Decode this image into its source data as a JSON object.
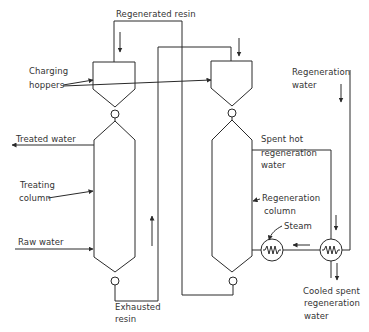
{
  "diagram": {
    "type": "process-flow",
    "stroke_color": "#2a2a2a",
    "labels": {
      "regenerated_resin": "Regenerated resin",
      "charging_hoppers_1": "Charging",
      "charging_hoppers_2": "hoppers",
      "treated_water": "Treated water",
      "treating_column_1": "Treating",
      "treating_column_2": "column",
      "raw_water": "Raw water",
      "exhausted_resin_1": "Exhausted",
      "exhausted_resin_2": "resin",
      "regeneration_water_1": "Regeneration",
      "regeneration_water_2": "water",
      "spent_hot_1": "Spent hot",
      "spent_hot_2": "regeneration",
      "spent_hot_3": "water",
      "regeneration_column_1": "Regeneration",
      "regeneration_column_2": "column",
      "steam": "Steam",
      "cooled_spent_1": "Cooled spent",
      "cooled_spent_2": "regeneration",
      "cooled_spent_3": "water"
    },
    "nodes": [
      {
        "id": "hopper-left",
        "label": "Charging hopper (treating)"
      },
      {
        "id": "hopper-right",
        "label": "Charging hopper (regeneration)"
      },
      {
        "id": "treating-column",
        "label": "Treating column"
      },
      {
        "id": "regeneration-column",
        "label": "Regeneration column"
      },
      {
        "id": "steam-heater",
        "label": "Steam heater"
      },
      {
        "id": "heat-exchanger",
        "label": "Heat exchanger"
      }
    ],
    "flows": [
      {
        "from": "raw-water",
        "to": "treating-column",
        "label": "Raw water"
      },
      {
        "from": "treating-column",
        "to": "out",
        "label": "Treated water"
      },
      {
        "from": "treating-column",
        "to": "hopper-right",
        "label": "Exhausted resin"
      },
      {
        "from": "regeneration-column",
        "to": "hopper-left",
        "label": "Regenerated resin"
      },
      {
        "from": "regeneration-water",
        "to": "heat-exchanger",
        "label": "Regeneration water"
      },
      {
        "from": "heat-exchanger",
        "to": "steam-heater",
        "label": ""
      },
      {
        "from": "steam-heater",
        "to": "regeneration-column",
        "label": "Steam"
      },
      {
        "from": "regeneration-column",
        "to": "heat-exchanger",
        "label": "Spent hot regeneration water"
      },
      {
        "from": "heat-exchanger",
        "to": "out",
        "label": "Cooled spent regeneration water"
      }
    ]
  }
}
